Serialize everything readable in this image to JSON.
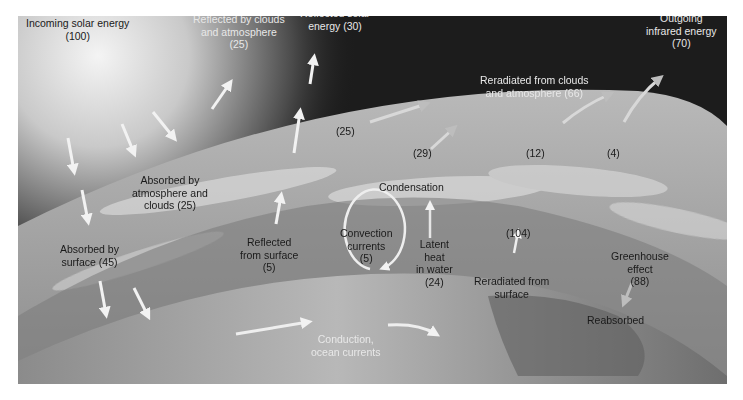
{
  "diagram": {
    "labels": {
      "incoming": {
        "line1": "Incoming solar energy",
        "line2": "(100)"
      },
      "reflected_clouds": {
        "line1": "Reflected by clouds",
        "line2": "and atmosphere",
        "line3": "(25)"
      },
      "reflected_solar": {
        "line1": "Reflected solar",
        "line2": "energy (30)"
      },
      "outgoing_ir": {
        "line1": "Outgoing",
        "line2": "infrared energy",
        "line3": "(70)"
      },
      "reradiated_clouds": {
        "line1": "Reradiated from clouds",
        "line2": "and atmosphere (66)"
      },
      "val_25": "(25)",
      "val_29": "(29)",
      "val_12": "(12)",
      "val_4": "(4)",
      "absorbed_atmo": {
        "line1": "Absorbed by",
        "line2": "atmosphere and",
        "line3": "clouds (25)"
      },
      "condensation": "Condensation",
      "convection": {
        "line1": "Convection",
        "line2": "currents",
        "line3": "(5)"
      },
      "latent_heat": {
        "line1": "Latent",
        "line2": "heat",
        "line3": "in water",
        "line4": "(24)"
      },
      "val_104": "(104)",
      "reradiated_surface": {
        "line1": "Reradiated from",
        "line2": "surface"
      },
      "greenhouse": {
        "line1": "Greenhouse",
        "line2": "effect",
        "line3": "(88)"
      },
      "absorbed_surface": {
        "line1": "Absorbed by",
        "line2": "surface (45)"
      },
      "reflected_surface": {
        "line1": "Reflected",
        "line2": "from surface",
        "line3": "(5)"
      },
      "reabsorbed": "Reabsorbed",
      "conduction": {
        "line1": "Conduction,",
        "line2": "ocean currents"
      }
    },
    "colors": {
      "space": "#1c1c1c",
      "atmosphere": "#a8a8a8",
      "earth": "#8a8a8a",
      "arrow_light": "#f2f2f2",
      "arrow_grey": "#bdbdbd"
    }
  }
}
